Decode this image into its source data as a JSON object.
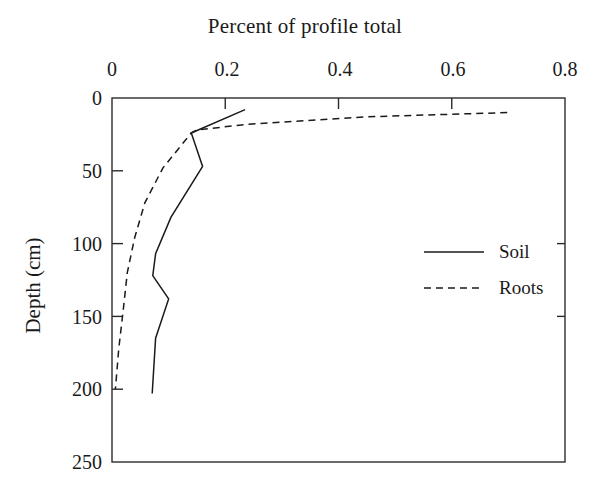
{
  "chart_data": {
    "type": "line",
    "title": "Percent of profile total",
    "xlabel": "",
    "ylabel": "Depth (cm)",
    "xlim": [
      0,
      0.8
    ],
    "ylim": [
      0,
      250
    ],
    "y_inverted": true,
    "grid": false,
    "legend_position": "center-right",
    "xticks": [
      "0",
      "0.2",
      "0.4",
      "0.6",
      "0.8"
    ],
    "xtick_values": [
      0,
      0.2,
      0.4,
      0.6,
      0.8
    ],
    "yticks": [
      "0",
      "50",
      "100",
      "150",
      "200",
      "250"
    ],
    "ytick_values": [
      0,
      50,
      100,
      150,
      200,
      250
    ],
    "series": [
      {
        "name": "Soil",
        "style": "solid",
        "color": "#1a1a1a",
        "x": [
          0.235,
          0.14,
          0.16,
          0.104,
          0.077,
          0.072,
          0.1,
          0.077,
          0.071
        ],
        "depth": [
          8,
          24,
          47,
          82,
          107,
          122,
          138,
          165,
          203
        ]
      },
      {
        "name": "Roots",
        "style": "dashed",
        "color": "#1a1a1a",
        "x": [
          0.698,
          0.445,
          0.24,
          0.15,
          0.14,
          0.09,
          0.058,
          0.04,
          0.027,
          0.02,
          0.012,
          0.006
        ],
        "depth": [
          10,
          13,
          18,
          22,
          24,
          48,
          72,
          96,
          120,
          145,
          172,
          200
        ]
      }
    ],
    "legend": [
      {
        "label": "Soil",
        "style": "solid"
      },
      {
        "label": "Roots",
        "style": "dashed"
      }
    ]
  }
}
